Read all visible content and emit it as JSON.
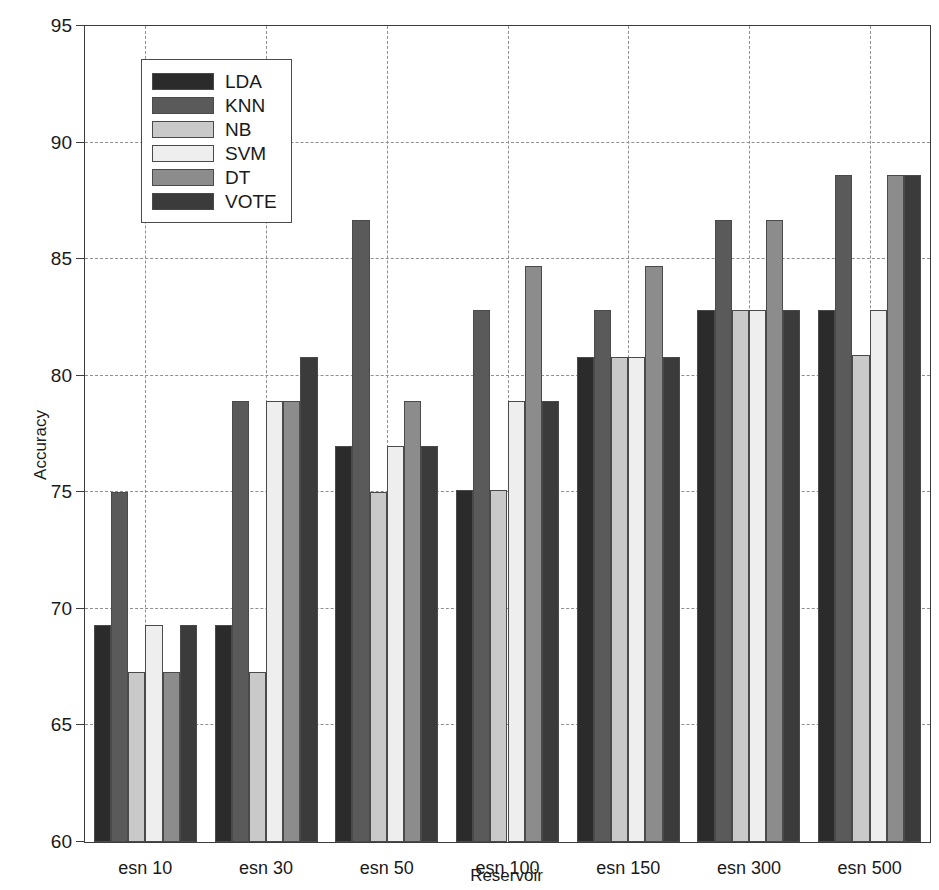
{
  "chart_data": {
    "type": "bar",
    "title": "",
    "xlabel": "Reservoir",
    "ylabel": "Accuracy",
    "ylim": [
      60,
      95
    ],
    "ytick_step": 5,
    "yticks": [
      60,
      65,
      70,
      75,
      80,
      85,
      90,
      95
    ],
    "grid": true,
    "legend_position": "upper-left-inside",
    "categories": [
      "esn 10",
      "esn 30",
      "esn 50",
      "esn 100",
      "esn 150",
      "esn 300",
      "esn 500"
    ],
    "series": [
      {
        "name": "LDA",
        "color": "#2b2b2b",
        "values": [
          69.3,
          69.3,
          77.0,
          75.1,
          80.8,
          82.8,
          82.8
        ]
      },
      {
        "name": "KNN",
        "color": "#5a5a5a",
        "values": [
          75.0,
          78.9,
          86.7,
          82.8,
          82.8,
          86.7,
          88.6
        ]
      },
      {
        "name": "NB",
        "color": "#c9c9c9",
        "values": [
          67.3,
          67.3,
          75.0,
          75.1,
          80.8,
          82.8,
          80.9
        ]
      },
      {
        "name": "SVM",
        "color": "#eeeeee",
        "values": [
          69.3,
          78.9,
          77.0,
          78.9,
          80.8,
          82.8,
          82.8
        ]
      },
      {
        "name": "DT",
        "color": "#8c8c8c",
        "values": [
          67.3,
          78.9,
          78.9,
          84.7,
          84.7,
          86.7,
          88.6
        ]
      },
      {
        "name": "VOTE",
        "color": "#3b3b3b",
        "values": [
          69.3,
          80.8,
          77.0,
          78.9,
          80.8,
          82.8,
          88.6
        ]
      }
    ]
  },
  "legend": {
    "items": [
      {
        "label": "LDA"
      },
      {
        "label": "KNN"
      },
      {
        "label": "NB"
      },
      {
        "label": "SVM"
      },
      {
        "label": "DT"
      },
      {
        "label": "VOTE"
      }
    ]
  }
}
